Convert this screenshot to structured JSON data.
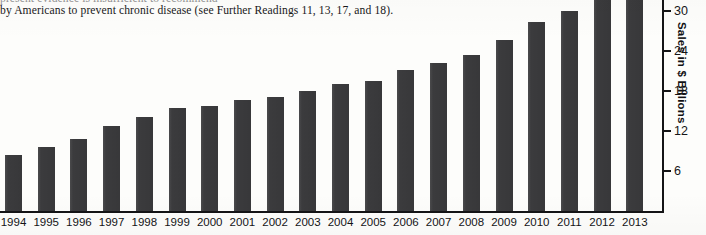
{
  "caption": {
    "clipped_line": "present evidence is insufficient to recommend",
    "line": "by Americans to prevent chronic disease (see Further Readings 11, 13, 17, and 18)."
  },
  "chart_data": {
    "type": "bar",
    "title": "",
    "xlabel": "",
    "ylabel": "Sales in $ Billions",
    "ylim": [
      0,
      36
    ],
    "yticks": [
      6,
      12,
      18,
      24,
      30
    ],
    "ytick_labels": [
      "6",
      "12",
      "18",
      "24",
      "30"
    ],
    "grid": false,
    "legend": "none",
    "bar_color": "#3b3b3d",
    "axis_color": "#141416",
    "background_color": "#fdfdfb",
    "categories": [
      "1994",
      "1995",
      "1996",
      "1997",
      "1998",
      "1999",
      "2000",
      "2001",
      "2002",
      "2003",
      "2004",
      "2005",
      "2006",
      "2007",
      "2008",
      "2009",
      "2010",
      "2011",
      "2012",
      "2013"
    ],
    "values": [
      8.6,
      9.7,
      11.0,
      12.9,
      14.3,
      15.6,
      15.9,
      16.8,
      17.3,
      18.1,
      19.2,
      19.6,
      21.3,
      22.4,
      23.6,
      25.8,
      28.5,
      30.2,
      33.5,
      34.5
    ]
  }
}
